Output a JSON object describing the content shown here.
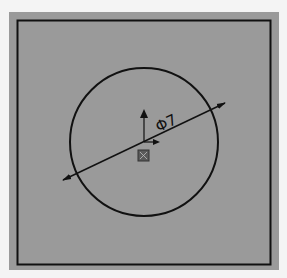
{
  "sketch": {
    "background_color": "#9a9a9a",
    "line_color": "#111111",
    "panel": {
      "x": 9,
      "y": 12,
      "w": 270,
      "h": 258
    },
    "border": {
      "x": 17,
      "y": 20,
      "w": 254,
      "h": 245
    },
    "circle": {
      "cx": 144,
      "cy": 142,
      "r": 74
    },
    "dimension": {
      "label": "Φ7",
      "line": {
        "x1": 63,
        "y1": 180,
        "x2": 225,
        "y2": 103
      }
    },
    "origin": {
      "x": 144,
      "y": 142
    }
  }
}
